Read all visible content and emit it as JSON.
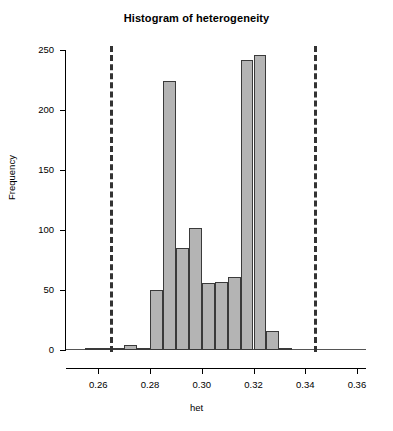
{
  "chart_data": {
    "type": "bar",
    "title": "Histogram of heterogeneity",
    "xlabel": "het",
    "ylabel": "Frequency",
    "xlim": [
      0.2475,
      0.3635
    ],
    "ylim": [
      0,
      250
    ],
    "bin_width": 0.005,
    "grid": false,
    "legend": null,
    "x_ticks": [
      0.26,
      0.28,
      0.3,
      0.32,
      0.34,
      0.36
    ],
    "x_tick_labels": [
      "0.26",
      "0.28",
      "0.30",
      "0.32",
      "0.34",
      "0.36"
    ],
    "y_ticks": [
      0,
      50,
      100,
      150,
      200,
      250
    ],
    "y_tick_labels": [
      "0",
      "50",
      "100",
      "150",
      "200",
      "250"
    ],
    "bin_starts": [
      0.255,
      0.26,
      0.265,
      0.27,
      0.275,
      0.28,
      0.285,
      0.29,
      0.295,
      0.3,
      0.305,
      0.31,
      0.315,
      0.32,
      0.325,
      0.33
    ],
    "values": [
      1,
      2,
      1,
      4,
      1,
      50,
      224,
      85,
      102,
      56,
      57,
      61,
      242,
      246,
      16,
      2
    ],
    "annotations": [
      {
        "name": "lower-threshold-line",
        "x": 0.2645,
        "style": "dashed-vertical"
      },
      {
        "name": "upper-threshold-line",
        "x": 0.3435,
        "style": "dashed-vertical"
      }
    ],
    "colors": {
      "bar_fill": "#b4b4b4",
      "bar_border": "#3a3a3a",
      "axis": "#000000",
      "vline": "#333333"
    }
  }
}
